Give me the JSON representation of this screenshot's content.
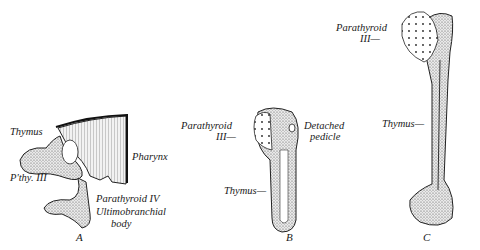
{
  "figure": {
    "panels": [
      {
        "id": "A",
        "caption": "A",
        "labels": {
          "thymus": "Thymus",
          "pthy3": "P'thy. III",
          "pharynx": "Pharynx",
          "parathyroid4": "Parathyroid IV",
          "ultimo1": "Ultimobranchial",
          "ultimo2": "body"
        }
      },
      {
        "id": "B",
        "caption": "B",
        "labels": {
          "parathyroid1": "Parathyroid",
          "parathyroid2": "III—",
          "detached1": "Detached",
          "detached2": "pedicle",
          "thymus": "Thymus—"
        }
      },
      {
        "id": "C",
        "caption": "C",
        "labels": {
          "parathyroid1": "Parathyroid",
          "parathyroid2": "III—",
          "thymus": "Thymus—"
        }
      }
    ]
  }
}
